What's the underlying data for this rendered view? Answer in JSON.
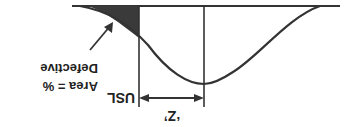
{
  "diagram": {
    "orientation": "rotated 180 degrees",
    "labels": {
      "usl": "USL",
      "z": "‘Z’",
      "area_line1": "Area = %",
      "area_line2": "Defective"
    },
    "colors": {
      "line": "#333333",
      "shaded": "#3a3a3a",
      "background": "#ffffff"
    }
  }
}
